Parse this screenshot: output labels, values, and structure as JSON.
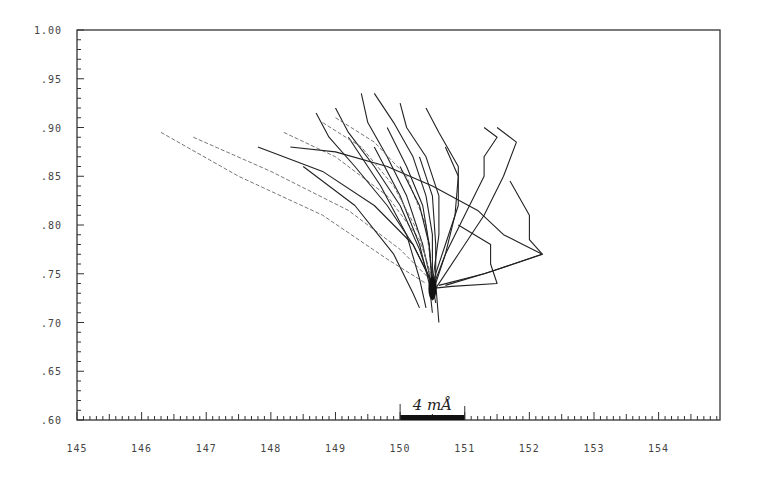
{
  "chart_data": {
    "type": "line",
    "title": "",
    "xlabel": "",
    "ylabel": "",
    "xlim": [
      145,
      155
    ],
    "ylim": [
      0.6,
      1.0
    ],
    "grid": false,
    "legend": null,
    "x_ticks": [
      145,
      146,
      147,
      148,
      149,
      150,
      151,
      152,
      153,
      154
    ],
    "x_tick_labels": [
      "145",
      "146",
      "147",
      "148",
      "149",
      "150",
      "151",
      "152",
      "153",
      "154"
    ],
    "y_ticks": [
      1.0,
      0.95,
      0.9,
      0.85,
      0.8,
      0.75,
      0.7,
      0.65,
      0.6
    ],
    "y_tick_labels": [
      "1.00",
      ".95",
      ".90",
      ".85",
      ".80",
      ".75",
      ".70",
      ".65",
      ".60"
    ],
    "annotations": [
      {
        "text": "4 mÅ",
        "type": "scale-bar",
        "x_start": 150.0,
        "x_end": 151.0,
        "y": 0.6
      }
    ],
    "convergence_point": {
      "x": 150.5,
      "y": 0.735
    },
    "series": [
      {
        "name": "trace-1",
        "style": "faint",
        "points": [
          [
            146.3,
            0.895
          ],
          [
            147.5,
            0.85
          ],
          [
            148.8,
            0.81
          ],
          [
            149.8,
            0.765
          ],
          [
            150.4,
            0.74
          ]
        ]
      },
      {
        "name": "trace-2",
        "style": "faint",
        "points": [
          [
            146.8,
            0.89
          ],
          [
            148.0,
            0.855
          ],
          [
            149.2,
            0.815
          ],
          [
            150.0,
            0.775
          ],
          [
            150.45,
            0.745
          ]
        ]
      },
      {
        "name": "trace-3",
        "style": "solid",
        "points": [
          [
            147.8,
            0.88
          ],
          [
            148.8,
            0.855
          ],
          [
            149.6,
            0.82
          ],
          [
            150.2,
            0.78
          ],
          [
            150.5,
            0.74
          ]
        ]
      },
      {
        "name": "trace-4",
        "style": "faint",
        "points": [
          [
            148.2,
            0.895
          ],
          [
            149.0,
            0.87
          ],
          [
            149.8,
            0.83
          ],
          [
            150.3,
            0.785
          ],
          [
            150.5,
            0.745
          ]
        ]
      },
      {
        "name": "trace-5",
        "style": "solid",
        "points": [
          [
            148.3,
            0.88
          ],
          [
            149.0,
            0.875
          ],
          [
            149.8,
            0.86
          ],
          [
            150.5,
            0.84
          ],
          [
            151.2,
            0.815
          ],
          [
            151.6,
            0.79
          ],
          [
            151.9,
            0.78
          ],
          [
            152.2,
            0.77
          ],
          [
            151.3,
            0.75
          ],
          [
            150.6,
            0.738
          ]
        ]
      },
      {
        "name": "trace-6",
        "style": "solid",
        "points": [
          [
            148.7,
            0.915
          ],
          [
            148.9,
            0.89
          ],
          [
            149.3,
            0.86
          ],
          [
            149.8,
            0.82
          ],
          [
            150.2,
            0.78
          ],
          [
            150.5,
            0.74
          ]
        ]
      },
      {
        "name": "trace-7",
        "style": "solid",
        "points": [
          [
            149.0,
            0.92
          ],
          [
            149.2,
            0.895
          ],
          [
            149.6,
            0.86
          ],
          [
            150.0,
            0.82
          ],
          [
            150.3,
            0.775
          ],
          [
            150.5,
            0.735
          ]
        ]
      },
      {
        "name": "trace-8",
        "style": "solid",
        "points": [
          [
            149.4,
            0.935
          ],
          [
            149.5,
            0.905
          ],
          [
            149.8,
            0.87
          ],
          [
            150.1,
            0.83
          ],
          [
            150.35,
            0.78
          ],
          [
            150.5,
            0.735
          ]
        ]
      },
      {
        "name": "trace-9",
        "style": "solid",
        "points": [
          [
            149.6,
            0.935
          ],
          [
            149.9,
            0.905
          ],
          [
            150.2,
            0.87
          ],
          [
            150.4,
            0.83
          ],
          [
            150.5,
            0.79
          ],
          [
            150.5,
            0.74
          ]
        ]
      },
      {
        "name": "trace-10",
        "style": "solid",
        "points": [
          [
            150.0,
            0.925
          ],
          [
            150.1,
            0.9
          ],
          [
            150.4,
            0.87
          ],
          [
            150.6,
            0.83
          ],
          [
            150.6,
            0.79
          ],
          [
            150.5,
            0.74
          ]
        ]
      },
      {
        "name": "trace-11",
        "style": "solid",
        "points": [
          [
            150.4,
            0.92
          ],
          [
            150.6,
            0.895
          ],
          [
            150.9,
            0.86
          ],
          [
            150.9,
            0.82
          ],
          [
            150.7,
            0.78
          ],
          [
            150.5,
            0.74
          ]
        ]
      },
      {
        "name": "trace-12",
        "style": "solid",
        "points": [
          [
            151.3,
            0.9
          ],
          [
            151.5,
            0.89
          ],
          [
            151.3,
            0.87
          ],
          [
            151.3,
            0.85
          ],
          [
            151.0,
            0.81
          ],
          [
            150.7,
            0.77
          ],
          [
            150.5,
            0.735
          ]
        ]
      },
      {
        "name": "trace-13",
        "style": "solid",
        "points": [
          [
            151.5,
            0.9
          ],
          [
            151.8,
            0.885
          ],
          [
            151.6,
            0.85
          ],
          [
            151.3,
            0.81
          ],
          [
            150.9,
            0.77
          ],
          [
            150.55,
            0.735
          ]
        ]
      },
      {
        "name": "trace-14",
        "style": "solid",
        "points": [
          [
            151.7,
            0.845
          ],
          [
            152.0,
            0.81
          ],
          [
            152.0,
            0.785
          ],
          [
            152.2,
            0.77
          ],
          [
            151.4,
            0.752
          ],
          [
            150.7,
            0.738
          ]
        ]
      },
      {
        "name": "trace-15",
        "style": "solid",
        "points": [
          [
            150.9,
            0.8
          ],
          [
            151.4,
            0.78
          ],
          [
            151.4,
            0.76
          ],
          [
            151.5,
            0.74
          ],
          [
            150.8,
            0.737
          ],
          [
            150.5,
            0.735
          ]
        ]
      },
      {
        "name": "trace-16",
        "style": "solid",
        "points": [
          [
            149.2,
            0.89
          ],
          [
            149.7,
            0.84
          ],
          [
            150.1,
            0.79
          ],
          [
            150.3,
            0.745
          ],
          [
            150.4,
            0.715
          ]
        ]
      },
      {
        "name": "trace-17",
        "style": "solid",
        "points": [
          [
            149.6,
            0.88
          ],
          [
            150.0,
            0.83
          ],
          [
            150.3,
            0.78
          ],
          [
            150.45,
            0.74
          ],
          [
            150.5,
            0.71
          ]
        ]
      },
      {
        "name": "trace-18",
        "style": "solid",
        "points": [
          [
            150.3,
            0.87
          ],
          [
            150.5,
            0.83
          ],
          [
            150.55,
            0.78
          ],
          [
            150.55,
            0.74
          ],
          [
            150.6,
            0.7
          ]
        ]
      },
      {
        "name": "trace-19",
        "style": "solid",
        "points": [
          [
            148.5,
            0.86
          ],
          [
            149.3,
            0.82
          ],
          [
            149.9,
            0.77
          ],
          [
            150.2,
            0.73
          ],
          [
            150.3,
            0.715
          ]
        ]
      },
      {
        "name": "trace-20",
        "style": "faint",
        "points": [
          [
            148.8,
            0.905
          ],
          [
            149.4,
            0.88
          ],
          [
            149.9,
            0.84
          ],
          [
            150.3,
            0.79
          ],
          [
            150.5,
            0.74
          ]
        ]
      },
      {
        "name": "trace-21",
        "style": "faint",
        "points": [
          [
            149.0,
            0.91
          ],
          [
            149.6,
            0.885
          ],
          [
            150.1,
            0.85
          ],
          [
            150.4,
            0.8
          ],
          [
            150.5,
            0.745
          ]
        ]
      },
      {
        "name": "trace-22",
        "style": "solid",
        "points": [
          [
            150.7,
            0.88
          ],
          [
            150.9,
            0.85
          ],
          [
            150.85,
            0.81
          ],
          [
            150.7,
            0.77
          ],
          [
            150.5,
            0.73
          ]
        ]
      },
      {
        "name": "trace-23",
        "style": "solid",
        "points": [
          [
            150.0,
            0.86
          ],
          [
            150.3,
            0.82
          ],
          [
            150.45,
            0.78
          ],
          [
            150.5,
            0.74
          ],
          [
            150.55,
            0.72
          ]
        ]
      },
      {
        "name": "trace-24",
        "style": "solid",
        "points": [
          [
            149.8,
            0.9
          ],
          [
            150.1,
            0.86
          ],
          [
            150.35,
            0.82
          ],
          [
            150.45,
            0.78
          ],
          [
            150.5,
            0.735
          ]
        ]
      }
    ]
  }
}
